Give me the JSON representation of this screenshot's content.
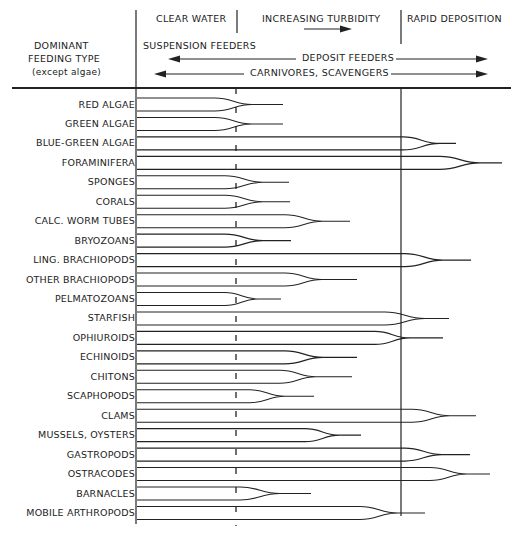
{
  "header": {
    "left_title": [
      "DOMINANT",
      "FEEDING TYPE",
      "(except algae)"
    ],
    "zone_clear": "CLEAR WATER",
    "zone_turbidity": "INCREASING TURBIDITY",
    "zone_deposition": "RAPID DEPOSITION",
    "suspension_feeders": "SUSPENSION FEEDERS",
    "deposit_feeders": "DEPOSIT FEEDERS",
    "carnivores": "CARNIVORES, SCAVENGERS"
  },
  "colors": {
    "ink": "#222222",
    "background": "#ffffff"
  },
  "diagram": {
    "type": "range-taper chart",
    "axis_note": "Horizontal axis is a turbidity gradient; each organism's band narrows to a point where it ceases to be tolerant.",
    "rows": [
      {
        "label": "RED ALGAE",
        "taper_start": 215,
        "point": 252,
        "tail": 283
      },
      {
        "label": "GREEN ALGAE",
        "taper_start": 215,
        "point": 252,
        "tail": 283
      },
      {
        "label": "BLUE-GREEN ALGAE",
        "taper_start": 403,
        "point": 440,
        "tail": 456
      },
      {
        "label": "FORAMINIFERA",
        "taper_start": 440,
        "point": 480,
        "tail": 502
      },
      {
        "label": "SPONGES",
        "taper_start": 225,
        "point": 263,
        "tail": 289
      },
      {
        "label": "CORALS",
        "taper_start": 225,
        "point": 263,
        "tail": 290
      },
      {
        "label": "CALC. WORM TUBES",
        "taper_start": 285,
        "point": 323,
        "tail": 350
      },
      {
        "label": "BRYOZOANS",
        "taper_start": 225,
        "point": 263,
        "tail": 291
      },
      {
        "label": "LING. BRACHIOPODS",
        "taper_start": 405,
        "point": 443,
        "tail": 471
      },
      {
        "label": "OTHER BRACHIOPODS",
        "taper_start": 285,
        "point": 322,
        "tail": 357
      },
      {
        "label": "PELMATOZOANS",
        "taper_start": 225,
        "point": 258,
        "tail": 281
      },
      {
        "label": "STARFISH",
        "taper_start": 385,
        "point": 425,
        "tail": 449
      },
      {
        "label": "OPHIUROIDS",
        "taper_start": 375,
        "point": 410,
        "tail": 443
      },
      {
        "label": "ECHINOIDS",
        "taper_start": 285,
        "point": 323,
        "tail": 357
      },
      {
        "label": "CHITONS",
        "taper_start": 280,
        "point": 316,
        "tail": 352
      },
      {
        "label": "SCAPHOPODS",
        "taper_start": 250,
        "point": 285,
        "tail": 314
      },
      {
        "label": "CLAMS",
        "taper_start": 412,
        "point": 450,
        "tail": 476
      },
      {
        "label": "MUSSELS, OYSTERS",
        "taper_start": 305,
        "point": 340,
        "tail": 361
      },
      {
        "label": "GASTROPODS",
        "taper_start": 405,
        "point": 442,
        "tail": 470
      },
      {
        "label": "OSTRACODES",
        "taper_start": 430,
        "point": 467,
        "tail": 490
      },
      {
        "label": "BARNACLES",
        "taper_start": 240,
        "point": 280,
        "tail": 311
      },
      {
        "label": "MOBILE ARTHROPODS",
        "taper_start": 360,
        "point": 398,
        "tail": 425
      }
    ]
  }
}
